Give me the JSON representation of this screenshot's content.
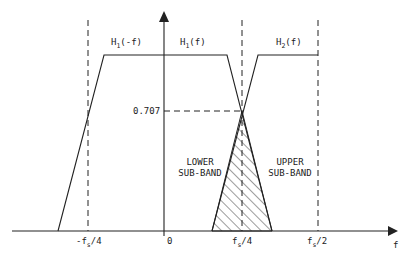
{
  "diagram": {
    "colors": {
      "ink": "#222222",
      "background": "#ffffff"
    },
    "axes": {
      "x_label": "f",
      "y_level_label": "0.707",
      "x_ticks": [
        {
          "label": "-f",
          "sub": "s",
          "suffix": "/4"
        },
        {
          "label": "0",
          "sub": "",
          "suffix": ""
        },
        {
          "label": "f",
          "sub": "s",
          "suffix": "/4"
        },
        {
          "label": "f",
          "sub": "s",
          "suffix": "/2"
        }
      ]
    },
    "curves": [
      {
        "name": "H",
        "sub": "1",
        "arg": "(-f)"
      },
      {
        "name": "H",
        "sub": "1",
        "arg": "(f)"
      },
      {
        "name": "H",
        "sub": "2",
        "arg": "(f)"
      }
    ],
    "regions": {
      "lower_line1": "LOWER",
      "lower_line2": "SUB-BAND",
      "upper_line1": "UPPER",
      "upper_line2": "SUB-BAND"
    }
  }
}
